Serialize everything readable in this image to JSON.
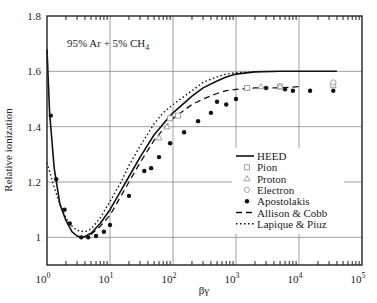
{
  "chart_data": {
    "type": "line",
    "title": "",
    "annotation": "95% Ar + 5% CH4",
    "annotation_main": "95% Ar + 5% CH",
    "annotation_sub": "4",
    "xlabel": "βγ",
    "ylabel": "Relative ionization",
    "xscale": "log",
    "xlim": [
      1,
      100000
    ],
    "ylim": [
      0.9,
      1.8
    ],
    "grid": true,
    "legend_position": "lower right (inside)",
    "x_ticks": [
      {
        "base": "10",
        "exp": "0",
        "value": 1
      },
      {
        "base": "10",
        "exp": "1",
        "value": 10
      },
      {
        "base": "10",
        "exp": "2",
        "value": 100
      },
      {
        "base": "10",
        "exp": "3",
        "value": 1000
      },
      {
        "base": "10",
        "exp": "4",
        "value": 10000
      },
      {
        "base": "10",
        "exp": "5",
        "value": 100000
      }
    ],
    "y_ticks": [
      "1",
      "1.2",
      "1.4",
      "1.6",
      "1.8"
    ],
    "y_tick_values": [
      1.0,
      1.2,
      1.4,
      1.6,
      1.8
    ],
    "legend": [
      {
        "label": "HEED",
        "style": "solid"
      },
      {
        "label": "Pion",
        "style": "open-square"
      },
      {
        "label": "Proton",
        "style": "open-triangle"
      },
      {
        "label": "Electron",
        "style": "open-circle"
      },
      {
        "label": "Apostolakis",
        "style": "filled-circle"
      },
      {
        "label": "Allison & Cobb",
        "style": "dashed"
      },
      {
        "label": "Lapique & Piuz",
        "style": "dotted"
      }
    ],
    "series": [
      {
        "name": "HEED",
        "style": "solid",
        "x": [
          1.0,
          1.1,
          1.3,
          1.6,
          2.0,
          2.5,
          3.0,
          3.5,
          4.0,
          5.0,
          7.0,
          10,
          15,
          20,
          30,
          50,
          70,
          100,
          200,
          300,
          500,
          700,
          1000,
          2000,
          5000,
          10000,
          20000,
          40000
        ],
        "y": [
          1.68,
          1.45,
          1.25,
          1.12,
          1.06,
          1.02,
          1.005,
          1.0,
          1.003,
          1.015,
          1.05,
          1.1,
          1.17,
          1.22,
          1.29,
          1.37,
          1.41,
          1.45,
          1.51,
          1.54,
          1.565,
          1.58,
          1.59,
          1.598,
          1.6,
          1.6,
          1.6,
          1.6
        ]
      },
      {
        "name": "Allison & Cobb",
        "style": "dashed",
        "x": [
          5,
          7,
          10,
          15,
          20,
          30,
          50,
          70,
          100,
          200,
          300,
          500,
          700,
          1000,
          2000,
          5000,
          10000
        ],
        "y": [
          1.01,
          1.04,
          1.08,
          1.15,
          1.2,
          1.27,
          1.35,
          1.39,
          1.43,
          1.48,
          1.5,
          1.52,
          1.53,
          1.535,
          1.54,
          1.54,
          1.545
        ]
      },
      {
        "name": "Lapique & Piuz",
        "style": "dotted",
        "x": [
          1.0,
          1.3,
          1.6,
          2.0,
          2.5,
          3.0,
          4.0,
          5.0,
          7.0,
          10,
          15,
          20,
          30,
          50,
          70,
          100,
          200,
          300,
          500,
          700,
          1000,
          2000
        ],
        "y": [
          1.27,
          1.18,
          1.12,
          1.07,
          1.04,
          1.025,
          1.02,
          1.03,
          1.07,
          1.13,
          1.2,
          1.26,
          1.33,
          1.41,
          1.45,
          1.48,
          1.53,
          1.56,
          1.58,
          1.59,
          1.595,
          1.598
        ]
      },
      {
        "name": "Apostolakis",
        "style": "filled-circle",
        "x": [
          1.15,
          1.4,
          1.9,
          2.3,
          3.5,
          4.5,
          6,
          8,
          10,
          20,
          35,
          45,
          60,
          90,
          150,
          250,
          400,
          500,
          700,
          1000,
          3000,
          6000,
          8000,
          15000,
          35000
        ],
        "y": [
          1.44,
          1.21,
          1.1,
          1.05,
          1.0,
          1.0,
          1.005,
          1.02,
          1.045,
          1.15,
          1.24,
          1.25,
          1.29,
          1.34,
          1.38,
          1.42,
          1.45,
          1.49,
          1.48,
          1.5,
          1.54,
          1.535,
          1.53,
          1.53,
          1.53
        ]
      },
      {
        "name": "Pion",
        "style": "open-square",
        "x": [
          90,
          120,
          1500,
          5000,
          35000
        ],
        "y": [
          1.43,
          1.44,
          1.54,
          1.545,
          1.55
        ]
      },
      {
        "name": "Proton",
        "style": "open-triangle",
        "x": [
          60,
          80,
          2500,
          5000
        ],
        "y": [
          1.36,
          1.4,
          1.545,
          1.545
        ]
      },
      {
        "name": "Electron",
        "style": "open-circle",
        "x": [
          35000
        ],
        "y": [
          1.56
        ]
      }
    ]
  }
}
